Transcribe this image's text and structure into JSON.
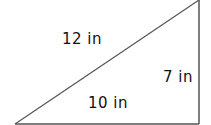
{
  "diagram": {
    "type": "right-triangle",
    "line_color": "#555555",
    "text_color": "#111111",
    "vertices": {
      "bottom_left": [
        15,
        124
      ],
      "bottom_right": [
        199,
        124
      ],
      "top_right": [
        199,
        0
      ]
    },
    "labels": {
      "hypotenuse": "12 in",
      "vertical_side": "7 in",
      "base_side": "10 in"
    }
  }
}
